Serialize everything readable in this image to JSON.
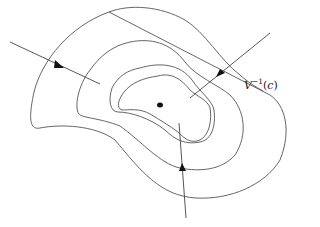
{
  "diagram": {
    "type": "level-set diagram",
    "label": {
      "base": "V",
      "superscript": "−1",
      "argument": "c",
      "open_paren": "(",
      "close_paren": ")"
    },
    "contour_count": 4,
    "trajectory_count": 3,
    "colors": {
      "stroke": "#555555",
      "arrowhead": "#111111",
      "background": "#ffffff"
    }
  }
}
